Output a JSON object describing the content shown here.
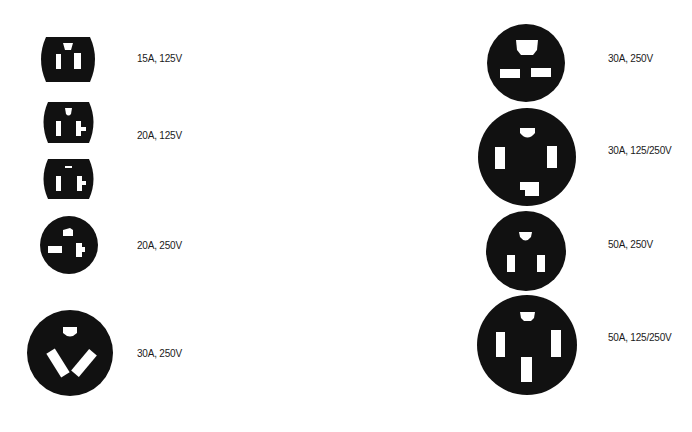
{
  "diagram": {
    "left_column": [
      {
        "id": "15a-125v",
        "label": "15A, 125V"
      },
      {
        "id": "20a-125v",
        "label": "20A, 125V"
      },
      {
        "id": "20a-250v",
        "label": "20A, 250V"
      },
      {
        "id": "30a-250v-left",
        "label": "30A, 250V"
      }
    ],
    "right_column": [
      {
        "id": "30a-250v-right",
        "label": "30A, 250V"
      },
      {
        "id": "30a-125-250v",
        "label": "30A, 125/250V"
      },
      {
        "id": "50a-250v",
        "label": "50A, 250V"
      },
      {
        "id": "50a-125-250v",
        "label": "50A, 125/250V"
      }
    ]
  },
  "colors": {
    "outlet_face": "#111111",
    "slot": "#ffffff",
    "background": "#ffffff",
    "label_text": "#1a1a1a"
  }
}
